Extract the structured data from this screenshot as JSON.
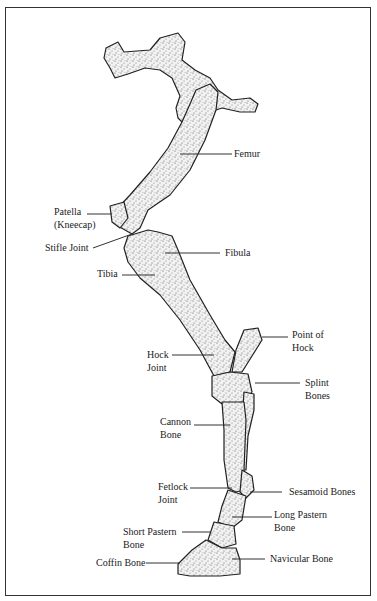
{
  "diagram": {
    "labels": {
      "femur": "Femur",
      "patella_1": "Patella",
      "patella_2": "(Kneecap)",
      "stifle_joint": "Stifle Joint",
      "fibula": "Fibula",
      "tibia": "Tibia",
      "point_of_hock_1": "Point of",
      "point_of_hock_2": "Hock",
      "hock_joint_1": "Hock",
      "hock_joint_2": "Joint",
      "splint_bones_1": "Splint",
      "splint_bones_2": "Bones",
      "cannon_bone_1": "Cannon",
      "cannon_bone_2": "Bone",
      "fetlock_joint_1": "Fetlock",
      "fetlock_joint_2": "Joint",
      "sesamoid_bones": "Sesamoid Bones",
      "long_pastern_1": "Long Pastern",
      "long_pastern_2": "Bone",
      "short_pastern_1": "Short Pastern",
      "short_pastern_2": "Bone",
      "coffin_bone": "Coffin Bone",
      "navicular_bone": "Navicular Bone"
    },
    "colors": {
      "bone_fill": "#e4e4e4",
      "outline": "#222222",
      "leader": "#333333"
    }
  }
}
